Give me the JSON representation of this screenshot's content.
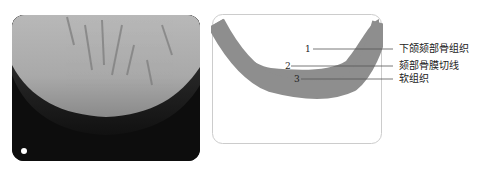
{
  "figure": {
    "left_panel": {
      "type": "radiograph",
      "subject": "mandible-chin-xray"
    },
    "right_panel": {
      "type": "schematic",
      "subject": "chin-cross-section"
    },
    "callouts": [
      {
        "number": "1",
        "label": "下颌颏部骨组织"
      },
      {
        "number": "2",
        "label": "颏部骨膜切线"
      },
      {
        "number": "3",
        "label": "软组织"
      }
    ],
    "colors": {
      "band": "#8e8e8e",
      "frame": "#cccccc",
      "leader": "#555555"
    }
  }
}
